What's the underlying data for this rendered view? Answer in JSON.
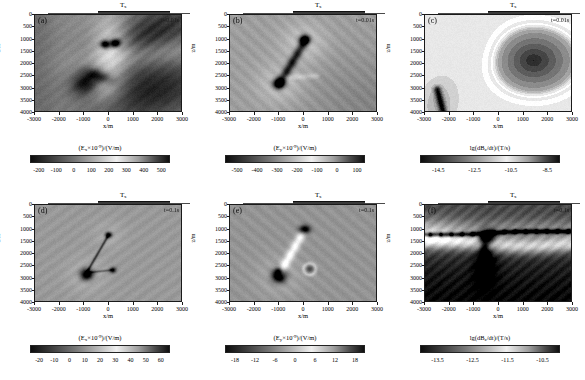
{
  "figure": {
    "axis": {
      "xlabel": "x/m",
      "ylabel": "z/m",
      "xticks": [
        "-3000",
        "-2000",
        "-1000",
        "0",
        "1000",
        "2000",
        "3000"
      ],
      "xtick_values": [
        -3000,
        -2000,
        -1000,
        0,
        1000,
        2000,
        3000
      ],
      "yticks": [
        "0",
        "500",
        "1000",
        "1500",
        "2000",
        "2500",
        "3000",
        "3500",
        "4000"
      ],
      "ytick_values": [
        0,
        500,
        1000,
        1500,
        2000,
        2500,
        3000,
        3500,
        4000
      ],
      "xlim": [
        -3000,
        3000
      ],
      "ylim": [
        0,
        4000
      ],
      "y_inverted": true
    },
    "source_marker": {
      "label": "T",
      "label_sub": "x"
    }
  },
  "chart_data": [
    {
      "type": "heatmap",
      "panel": "(a)",
      "title": "",
      "time_label": "t=0.01s",
      "xlabel": "x/m",
      "ylabel": "z/m",
      "xlim": [
        -3000,
        3000
      ],
      "ylim": [
        0,
        4000
      ],
      "grid": false,
      "colorbar": {
        "label_pre": "(E",
        "label_sub": "x",
        "label_mid": "×10",
        "label_sup": "-9",
        "label_post": ")/(V/m)",
        "label_plain": "(Ex×10⁻⁹)/(V/m)",
        "ticks": [
          "-200",
          "-100",
          "0",
          "100",
          "200",
          "300",
          "400",
          "500"
        ],
        "tick_values": [
          -200,
          -100,
          0,
          100,
          200,
          300,
          400,
          500
        ],
        "vmin": -250,
        "vmax": 550,
        "colormap": "gray-diverging"
      },
      "features": "Ex field at 0.01s: bright vertical plume near x=0 z=1200, dark lobes at x=-200..200 z=1100-1400, dark scatter band upper-right, dark anomaly cluster near x=-800 z=2500-3000."
    },
    {
      "type": "heatmap",
      "panel": "(b)",
      "title": "",
      "time_label": "t=0.01s",
      "xlabel": "x/m",
      "ylabel": "z/m",
      "xlim": [
        -3000,
        3000
      ],
      "ylim": [
        0,
        4000
      ],
      "grid": false,
      "colorbar": {
        "label_pre": "(E",
        "label_sub": "y",
        "label_mid": "×10",
        "label_sup": "-9",
        "label_post": ")/(V/m)",
        "label_plain": "(Ey×10⁻⁹)/(V/m)",
        "ticks": [
          "-500",
          "-400",
          "-300",
          "-200",
          "-100",
          "0",
          "100"
        ],
        "tick_values": [
          -500,
          -400,
          -300,
          -200,
          -100,
          0,
          100
        ],
        "vmin": -560,
        "vmax": 140,
        "colormap": "gray-diverging"
      },
      "features": "Ey field at 0.01s: dark blob near x=0 z=1000, elongated dark diagonal streak from (0,1000) to (-1000,2800), second dark blob at x=-1000 z=2800, faint halo rings."
    },
    {
      "type": "heatmap",
      "panel": "(c)",
      "title": "",
      "time_label": "t=0.01s",
      "xlabel": "x/m",
      "ylabel": "z/m",
      "xlim": [
        -3000,
        3000
      ],
      "ylim": [
        0,
        4000
      ],
      "grid": false,
      "colorbar": {
        "label_pre": "lg(dB",
        "label_sub": "z",
        "label_mid": "/dt)/(T/s)",
        "label_sup": "",
        "label_post": "",
        "label_plain": "lg(dBz/dt)/(T/s)",
        "ticks": [
          "-14.5",
          "-12.5",
          "-10.5",
          "-8.5"
        ],
        "tick_values": [
          -14.5,
          -12.5,
          -10.5,
          -8.5
        ],
        "vmin": -15.5,
        "vmax": -7.8,
        "colormap": "gray-contour"
      },
      "features": "lg(dBz/dt) at 0.01s: large dark concentric elliptical region centred near x=1400 z=1800, bright crescent arcs sweeping left, dark streak at x=-2400 z=3200-4000."
    },
    {
      "type": "heatmap",
      "panel": "(d)",
      "title": "",
      "time_label": "t=0.1s",
      "xlabel": "x/m",
      "ylabel": "z/m",
      "xlim": [
        -3000,
        3000
      ],
      "ylim": [
        0,
        4000
      ],
      "grid": false,
      "colorbar": {
        "label_pre": "(E",
        "label_sub": "x",
        "label_mid": "×10",
        "label_sup": "-9",
        "label_post": ")/(V/m)",
        "label_plain": "(Ex×10⁻⁹)/(V/m)",
        "ticks": [
          "-20",
          "-10",
          "0",
          "10",
          "20",
          "30",
          "40",
          "50",
          "60"
        ],
        "tick_values": [
          -20,
          -10,
          0,
          10,
          20,
          30,
          40,
          50,
          60
        ],
        "vmin": -26,
        "vmax": 66,
        "colormap": "gray-diverging"
      },
      "features": "Ex field at 0.1s: near-uniform mid-grey background, small dark dot at x=0 z=1200, thin dark diagonal line to x=-900 z=2800, dark blob at x=-900 z=2800, small dot at x=150 z=2650."
    },
    {
      "type": "heatmap",
      "panel": "(e)",
      "title": "",
      "time_label": "t=0.1s",
      "xlabel": "x/m",
      "ylabel": "z/m",
      "xlim": [
        -3000,
        3000
      ],
      "ylim": [
        0,
        4000
      ],
      "grid": false,
      "colorbar": {
        "label_pre": "(E",
        "label_sub": "y",
        "label_mid": "×10",
        "label_sup": "-9",
        "label_post": ")/(V/m)",
        "label_plain": "(Ey×10⁻⁹)/(V/m)",
        "ticks": [
          "-18",
          "-12",
          "-6",
          "0",
          "6",
          "12",
          "18"
        ],
        "tick_values": [
          -18,
          -12,
          -6,
          0,
          6,
          12,
          18
        ],
        "vmin": -21,
        "vmax": 21,
        "colormap": "gray-diverging"
      },
      "features": "Ey field at 0.1s: dark blob at x=0 z=1000, bright diagonal band down-left to x=-1000 z=2800, strong dark blob at x=-1000 z=2900, faint ring at x=200 z=2600."
    },
    {
      "type": "heatmap",
      "panel": "(f)",
      "title": "",
      "time_label": "t=0.1s",
      "xlabel": "x/m",
      "ylabel": "z/m",
      "xlim": [
        -3000,
        3000
      ],
      "ylim": [
        0,
        4000
      ],
      "grid": false,
      "colorbar": {
        "label_pre": "lg(dB",
        "label_sub": "z",
        "label_mid": "/dt)/(T/s)",
        "label_sup": "",
        "label_post": "",
        "label_plain": "lg(dBz/dt)/(T/s)",
        "ticks": [
          "-13.5",
          "-12.5",
          "-11.5",
          "-10.5"
        ],
        "tick_values": [
          -13.5,
          -12.5,
          -11.5,
          -10.5
        ],
        "vmin": -14.0,
        "vmax": -10.0,
        "colormap": "gray-contour"
      },
      "features": "lg(dBz/dt) at 0.1s: horizontal dark band of beads across z~1100, bright curved band below, dark wedge descending from x=-700 z=1400 to x=-500 z=2700, dark lower field."
    }
  ]
}
